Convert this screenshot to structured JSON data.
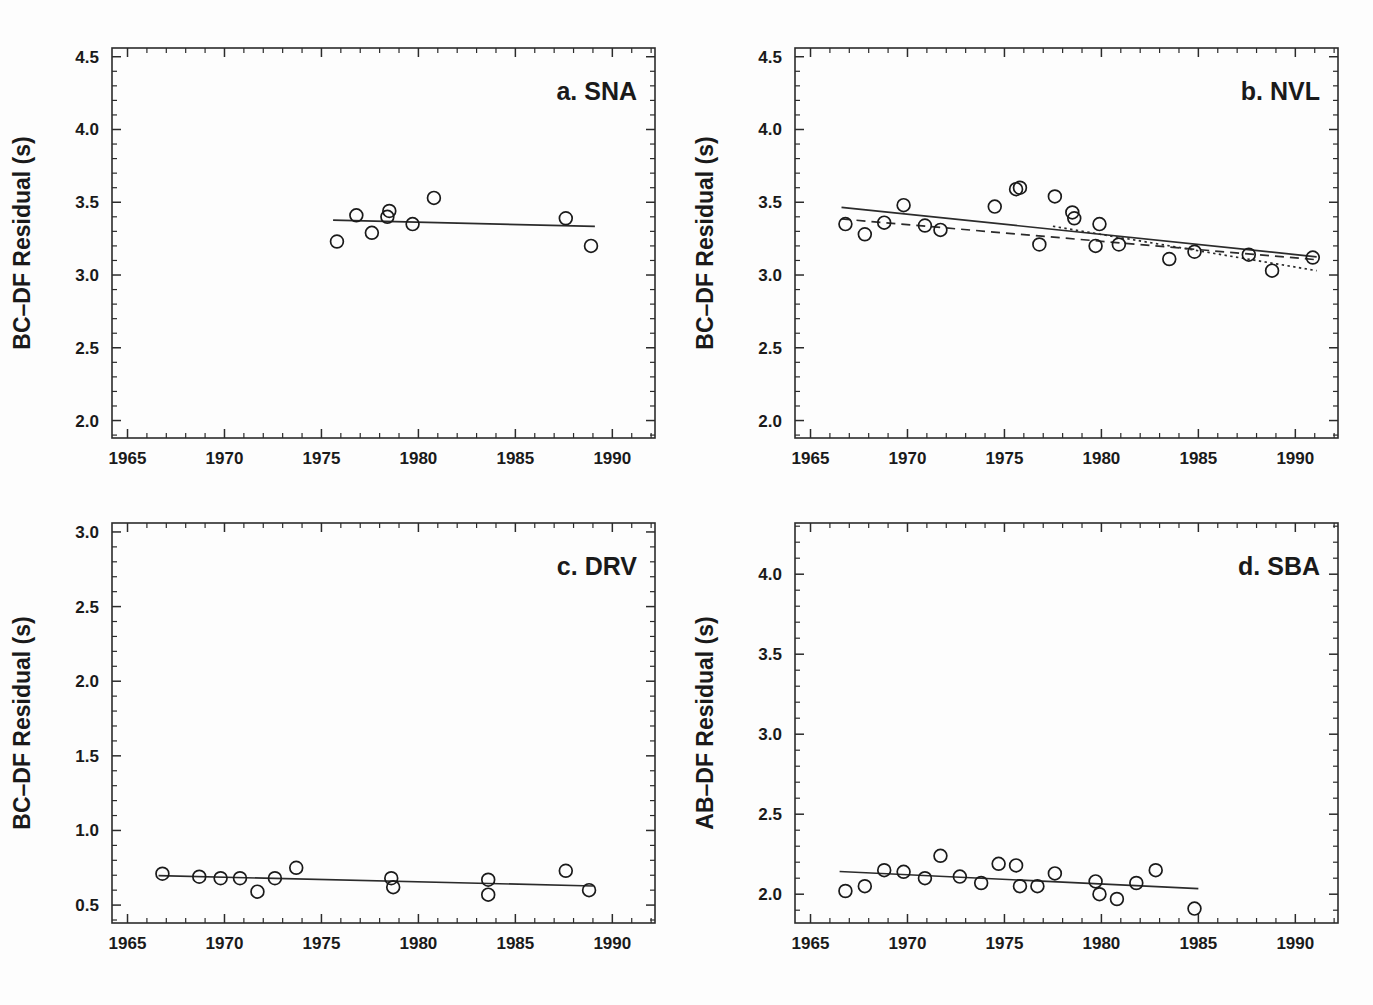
{
  "figure": {
    "background": "#fdfdfd",
    "foreground": "#1a1a1a",
    "panel_count": 4
  },
  "chart_data": [
    {
      "id": "sna",
      "type": "scatter",
      "title": "a. SNA",
      "label_letter": "a.",
      "station_code": "SNA",
      "xlabel": "",
      "ylabel": "BC–DF Residual (s)",
      "xlim": [
        1964.2,
        1992.2
      ],
      "ylim": [
        1.88,
        4.56
      ],
      "xticks": [
        1965,
        1970,
        1975,
        1980,
        1985,
        1990
      ],
      "xticklabels": [
        "1965",
        "1970",
        "1975",
        "1980",
        "1985",
        "1990"
      ],
      "yticks": [
        2.0,
        2.5,
        3.0,
        3.5,
        4.0,
        4.5
      ],
      "yticklabels": [
        "2.0",
        "2.5",
        "3.0",
        "3.5",
        "4.0",
        "4.5"
      ],
      "minor_tick_step_x": 1,
      "minor_tick_step_y": 0.1,
      "grid": false,
      "legend": "none",
      "marker": "open-circle",
      "points": [
        {
          "x": 1975.8,
          "y": 3.23
        },
        {
          "x": 1976.8,
          "y": 3.41
        },
        {
          "x": 1977.6,
          "y": 3.29
        },
        {
          "x": 1978.4,
          "y": 3.4
        },
        {
          "x": 1978.5,
          "y": 3.44
        },
        {
          "x": 1979.7,
          "y": 3.35
        },
        {
          "x": 1980.8,
          "y": 3.53
        },
        {
          "x": 1987.6,
          "y": 3.39
        },
        {
          "x": 1988.9,
          "y": 3.2
        }
      ],
      "fits": [
        {
          "style": "solid",
          "x0": 1975.6,
          "y0": 3.377,
          "x1": 1989.1,
          "y1": 3.334
        }
      ]
    },
    {
      "id": "nvl",
      "type": "scatter",
      "title": "b. NVL",
      "label_letter": "b.",
      "station_code": "NVL",
      "xlabel": "",
      "ylabel": "BC–DF Residual (s)",
      "xlim": [
        1964.2,
        1992.2
      ],
      "ylim": [
        1.88,
        4.56
      ],
      "xticks": [
        1965,
        1970,
        1975,
        1980,
        1985,
        1990
      ],
      "xticklabels": [
        "1965",
        "1970",
        "1975",
        "1980",
        "1985",
        "1990"
      ],
      "yticks": [
        2.0,
        2.5,
        3.0,
        3.5,
        4.0,
        4.5
      ],
      "yticklabels": [
        "2.0",
        "2.5",
        "3.0",
        "3.5",
        "4.0",
        "4.5"
      ],
      "minor_tick_step_x": 1,
      "minor_tick_step_y": 0.1,
      "grid": false,
      "legend": "none",
      "marker": "open-circle",
      "points": [
        {
          "x": 1966.8,
          "y": 3.35
        },
        {
          "x": 1967.8,
          "y": 3.28
        },
        {
          "x": 1968.8,
          "y": 3.36
        },
        {
          "x": 1969.8,
          "y": 3.48
        },
        {
          "x": 1970.9,
          "y": 3.34
        },
        {
          "x": 1971.7,
          "y": 3.31
        },
        {
          "x": 1974.5,
          "y": 3.47
        },
        {
          "x": 1975.6,
          "y": 3.59
        },
        {
          "x": 1975.8,
          "y": 3.6
        },
        {
          "x": 1976.8,
          "y": 3.21
        },
        {
          "x": 1977.6,
          "y": 3.54
        },
        {
          "x": 1978.5,
          "y": 3.43
        },
        {
          "x": 1978.6,
          "y": 3.39
        },
        {
          "x": 1979.7,
          "y": 3.2
        },
        {
          "x": 1979.9,
          "y": 3.35
        },
        {
          "x": 1980.9,
          "y": 3.21
        },
        {
          "x": 1983.5,
          "y": 3.11
        },
        {
          "x": 1984.8,
          "y": 3.16
        },
        {
          "x": 1987.6,
          "y": 3.14
        },
        {
          "x": 1988.8,
          "y": 3.03
        },
        {
          "x": 1990.9,
          "y": 3.12
        }
      ],
      "fits": [
        {
          "style": "solid",
          "x0": 1966.6,
          "y0": 3.465,
          "x1": 1991.1,
          "y1": 3.125
        },
        {
          "style": "dashed",
          "x0": 1966.6,
          "y0": 3.385,
          "x1": 1991.1,
          "y1": 3.105
        },
        {
          "style": "dotted",
          "x0": 1977.5,
          "y0": 3.335,
          "x1": 1991.1,
          "y1": 3.03
        }
      ]
    },
    {
      "id": "drv",
      "type": "scatter",
      "title": "c. DRV",
      "label_letter": "c.",
      "station_code": "DRV",
      "xlabel": "",
      "ylabel": "BC–DF Residual (s)",
      "xlim": [
        1964.2,
        1992.2
      ],
      "ylim": [
        0.38,
        3.06
      ],
      "xticks": [
        1965,
        1970,
        1975,
        1980,
        1985,
        1990
      ],
      "xticklabels": [
        "1965",
        "1970",
        "1975",
        "1980",
        "1985",
        "1990"
      ],
      "yticks": [
        0.5,
        1.0,
        1.5,
        2.0,
        2.5,
        3.0
      ],
      "yticklabels": [
        "0.5",
        "1.0",
        "1.5",
        "2.0",
        "2.5",
        "3.0"
      ],
      "minor_tick_step_x": 1,
      "minor_tick_step_y": 0.1,
      "grid": false,
      "legend": "none",
      "marker": "open-circle",
      "points": [
        {
          "x": 1966.8,
          "y": 0.71
        },
        {
          "x": 1968.7,
          "y": 0.69
        },
        {
          "x": 1969.8,
          "y": 0.68
        },
        {
          "x": 1970.8,
          "y": 0.68
        },
        {
          "x": 1971.7,
          "y": 0.59
        },
        {
          "x": 1972.6,
          "y": 0.68
        },
        {
          "x": 1973.7,
          "y": 0.75
        },
        {
          "x": 1978.6,
          "y": 0.68
        },
        {
          "x": 1978.7,
          "y": 0.62
        },
        {
          "x": 1983.6,
          "y": 0.67
        },
        {
          "x": 1983.6,
          "y": 0.57
        },
        {
          "x": 1987.6,
          "y": 0.73
        },
        {
          "x": 1988.8,
          "y": 0.6
        }
      ],
      "fits": [
        {
          "style": "solid",
          "x0": 1966.6,
          "y0": 0.697,
          "x1": 1989.0,
          "y1": 0.628
        }
      ]
    },
    {
      "id": "sba",
      "type": "scatter",
      "title": "d. SBA",
      "label_letter": "d.",
      "station_code": "SBA",
      "xlabel": "",
      "ylabel": "AB–DF Residual (s)",
      "xlim": [
        1964.2,
        1992.2
      ],
      "ylim": [
        1.82,
        4.32
      ],
      "xticks": [
        1965,
        1970,
        1975,
        1980,
        1985,
        1990
      ],
      "xticklabels": [
        "1965",
        "1970",
        "1975",
        "1980",
        "1985",
        "1990"
      ],
      "yticks": [
        2.0,
        2.5,
        3.0,
        3.5,
        4.0
      ],
      "yticklabels": [
        "2.0",
        "2.5",
        "3.0",
        "3.5",
        "4.0"
      ],
      "minor_tick_step_x": 1,
      "minor_tick_step_y": 0.1,
      "grid": false,
      "legend": "none",
      "marker": "open-circle",
      "points": [
        {
          "x": 1966.8,
          "y": 2.02
        },
        {
          "x": 1967.8,
          "y": 2.05
        },
        {
          "x": 1968.8,
          "y": 2.15
        },
        {
          "x": 1969.8,
          "y": 2.14
        },
        {
          "x": 1970.9,
          "y": 2.1
        },
        {
          "x": 1971.7,
          "y": 2.24
        },
        {
          "x": 1972.7,
          "y": 2.11
        },
        {
          "x": 1973.8,
          "y": 2.07
        },
        {
          "x": 1974.7,
          "y": 2.19
        },
        {
          "x": 1975.6,
          "y": 2.18
        },
        {
          "x": 1975.8,
          "y": 2.05
        },
        {
          "x": 1976.7,
          "y": 2.05
        },
        {
          "x": 1977.6,
          "y": 2.13
        },
        {
          "x": 1979.7,
          "y": 2.08
        },
        {
          "x": 1979.9,
          "y": 2.0
        },
        {
          "x": 1980.8,
          "y": 1.97
        },
        {
          "x": 1981.8,
          "y": 2.07
        },
        {
          "x": 1982.8,
          "y": 2.15
        },
        {
          "x": 1984.8,
          "y": 1.91
        }
      ],
      "fits": [
        {
          "style": "solid",
          "x0": 1966.5,
          "y0": 2.142,
          "x1": 1985.0,
          "y1": 2.035
        }
      ]
    }
  ]
}
